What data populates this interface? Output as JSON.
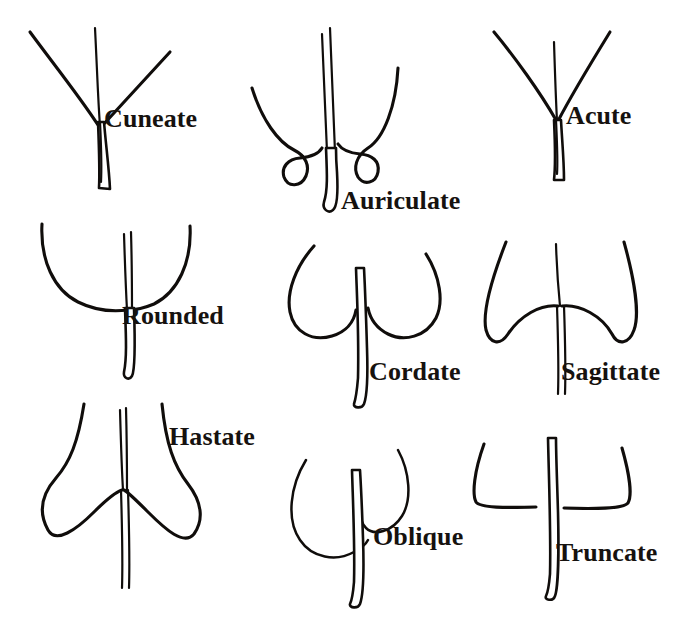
{
  "figure": {
    "background_color": "#ffffff",
    "ink_color": "#100d0b",
    "style": "hand-drawn pen and ink line illustration",
    "width": 692,
    "height": 638,
    "rows": 3,
    "columns": 3
  },
  "panels": [
    {
      "id": "cuneate",
      "label": "Cuneate",
      "description": "Narrow wedge-shaped base; blade margins descend in straight lines to the petiole forming a V",
      "row": 1,
      "column": 1,
      "label_x": 104,
      "label_y": 106
    },
    {
      "id": "auriculate",
      "label": "Auriculate",
      "description": "Base with small rounded ear-like lobes projecting outward at the petiole",
      "row": 1,
      "column": 2,
      "label_x": 341,
      "label_y": 188
    },
    {
      "id": "acute",
      "label": "Acute",
      "description": "Base tapering to a sharp angle of less than 90 degrees",
      "row": 1,
      "column": 3,
      "label_x": 566,
      "label_y": 103
    },
    {
      "id": "rounded",
      "label": "Rounded",
      "description": "Base curving evenly in a broad U shape to the petiole",
      "row": 2,
      "column": 1,
      "label_x": 122,
      "label_y": 303
    },
    {
      "id": "cordate",
      "label": "Cordate",
      "description": "Heart-shaped base with two rounded lobes and a deep notch at the petiole",
      "row": 2,
      "column": 2,
      "label_x": 369,
      "label_y": 359
    },
    {
      "id": "sagittate",
      "label": "Sagittate",
      "description": "Arrowhead-shaped base with two sharp lobes pointing downward",
      "row": 2,
      "column": 3,
      "label_x": 561,
      "label_y": 359
    },
    {
      "id": "hastate",
      "label": "Hastate",
      "description": "Spear-shaped base with two lobes flaring outward at roughly right angles",
      "row": 3,
      "column": 1,
      "label_x": 169,
      "label_y": 424
    },
    {
      "id": "oblique",
      "label": "Oblique",
      "description": "Asymmetric base in which one side is set lower on the petiole than the other",
      "row": 3,
      "column": 2,
      "label_x": 373,
      "label_y": 524
    },
    {
      "id": "truncate",
      "label": "Truncate",
      "description": "Base squared off, ending abruptly in a nearly straight horizontal line",
      "row": 3,
      "column": 3,
      "label_x": 556,
      "label_y": 540
    }
  ]
}
